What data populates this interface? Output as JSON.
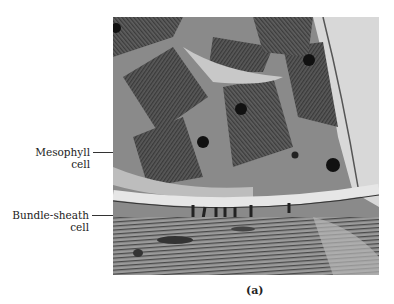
{
  "figure": {
    "panel_label": "(a)",
    "image_description": "Electron micrograph of mesophyll and bundle-sheath cells",
    "labels": [
      {
        "line1": "Mesophyll",
        "line2": "cell"
      },
      {
        "line1": "Bundle-sheath",
        "line2": "cell"
      }
    ]
  }
}
